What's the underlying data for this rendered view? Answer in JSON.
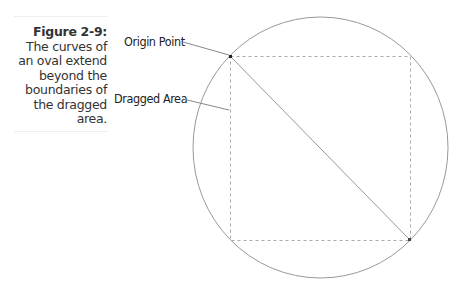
{
  "caption": {
    "figure_label": "Figure 2-9:",
    "text": "The curves of an oval extend beyond the boundaries of the dragged area."
  },
  "labels": {
    "origin_point": "Origin Point",
    "dragged_area": "Dragged Area"
  },
  "colors": {
    "outline": "#999999",
    "dashed": "#aaaaaa",
    "text": "#222222"
  }
}
